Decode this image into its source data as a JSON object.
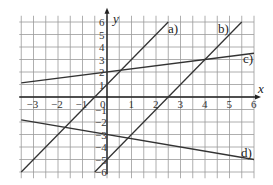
{
  "chart_data": {
    "type": "line",
    "title": "",
    "xlabel": "x",
    "ylabel": "y",
    "xlim": [
      -3.5,
      6
    ],
    "ylim": [
      -6.5,
      6.5
    ],
    "grid": true,
    "x_ticks": [
      "-3",
      "-2",
      "-1",
      "0",
      "1",
      "2",
      "3",
      "4",
      "5",
      "6"
    ],
    "y_ticks": [
      "6",
      "5",
      "4",
      "3",
      "2",
      "1",
      "-1",
      "-2",
      "-3",
      "-4",
      "-5",
      "-6"
    ],
    "series": [
      {
        "name": "a)",
        "equation": "y = 2x + 1",
        "slope": 2,
        "intercept": 1,
        "x_range": [
          -3.5,
          2.5
        ]
      },
      {
        "name": "b)",
        "equation": "y = 2x - 5",
        "slope": 2,
        "intercept": -5,
        "x_range": [
          -0.5,
          5.5
        ]
      },
      {
        "name": "c)",
        "equation": "y = 0.25x + 2",
        "slope": 0.25,
        "intercept": 2,
        "x_range": [
          -3.5,
          6
        ]
      },
      {
        "name": "d)",
        "equation": "y = -x/3 - 3",
        "slope": -0.3333,
        "intercept": -3,
        "x_range": [
          -3.5,
          6
        ]
      }
    ],
    "legend": "inline labels at line ends"
  },
  "labels": {
    "x_axis": "x",
    "y_axis": "y",
    "origin": "0",
    "a": "a)",
    "b": "b)",
    "c": "c)",
    "d": "d)"
  }
}
